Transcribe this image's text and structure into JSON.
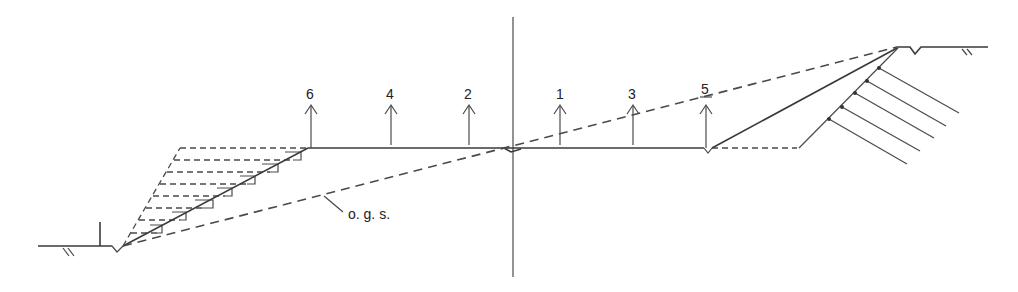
{
  "diagram": {
    "type": "road cross-section (cut and fill)",
    "colors": {
      "line": "#3a3a3a",
      "background": "#ffffff"
    },
    "labels": {
      "ground_surface": "o. g. s.",
      "stations": [
        {
          "id": "6",
          "label": "6",
          "x": 308
        },
        {
          "id": "4",
          "label": "4",
          "x": 390
        },
        {
          "id": "2",
          "label": "2",
          "x": 469
        },
        {
          "id": "1",
          "label": "1",
          "x": 560
        },
        {
          "id": "3",
          "label": "3",
          "x": 633
        },
        {
          "id": "5",
          "label": "5",
          "x": 706
        }
      ]
    },
    "elements": [
      "centerline",
      "roadway-surface",
      "fill-embankment-slope",
      "benched-steps",
      "original-ground-surface-dashed",
      "cut-slope",
      "anchor-rods",
      "ditches",
      "ground-hatch-marks"
    ]
  }
}
